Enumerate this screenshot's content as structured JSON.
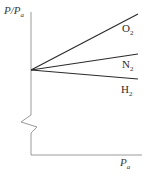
{
  "figure": {
    "background_color": "#ffffff",
    "axis_color": "#9a9a9a",
    "curve_color": "#2b2b2b"
  },
  "axes": {
    "y_label": "P/P",
    "y_label_sub": "a",
    "x_label": "P",
    "x_label_sub": "a",
    "y_break_present": "true"
  },
  "curves": [
    {
      "name": "O2",
      "label": "O",
      "label_sub": "2"
    },
    {
      "name": "N2",
      "label": "N",
      "label_sub": "2"
    },
    {
      "name": "H2",
      "label": "H",
      "label_sub": "2"
    }
  ],
  "chart_data": {
    "type": "line",
    "title": "",
    "xlabel": "P_a",
    "ylabel": "P/P_a",
    "grid": false,
    "legend": "inline-right-of-curve-ends",
    "axis_break": {
      "axis": "y",
      "style": "zigzag",
      "position_px_y": [
        115,
        133
      ]
    },
    "origin_px": {
      "x": 31,
      "y": 70
    },
    "x_axis_px": {
      "y": 155,
      "x_start": 31,
      "x_end": 142
    },
    "y_axis_px": {
      "x": 31,
      "y_top": 12,
      "y_bottom": 155
    },
    "series": [
      {
        "name": "O2",
        "points_px": [
          {
            "x": 31,
            "y": 70
          },
          {
            "x": 138,
            "y": 14
          }
        ],
        "slope_sign": "positive-steep",
        "description": "Oxygen shows the largest positive deviation of PV/RT ratio with pressure"
      },
      {
        "name": "N2",
        "points_px": [
          {
            "x": 31,
            "y": 70
          },
          {
            "x": 138,
            "y": 54
          }
        ],
        "slope_sign": "positive-shallow",
        "description": "Nitrogen shows a small positive deviation with pressure"
      },
      {
        "name": "H2",
        "points_px": [
          {
            "x": 31,
            "y": 70
          },
          {
            "x": 138,
            "y": 79
          }
        ],
        "slope_sign": "negative-shallow",
        "description": "Hydrogen shows a slight negative deviation with pressure"
      }
    ]
  }
}
